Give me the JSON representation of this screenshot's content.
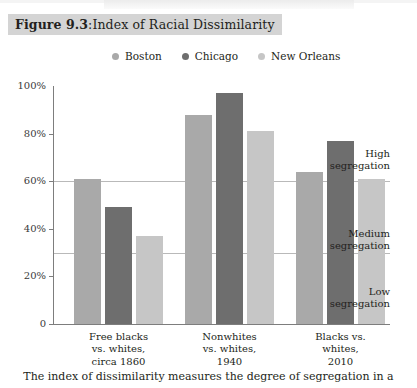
{
  "figure": {
    "number_label": "Figure 9.3",
    "separator": ": ",
    "title": "Index of Racial Dissimilarity",
    "caption": "The index of dissimilarity measures the degree of segregation in a"
  },
  "colors": {
    "boston": "#a9a9a9",
    "chicago": "#6e6e6e",
    "new_orleans": "#c6c6c6",
    "axis": "#7d7d7d",
    "reference_line": "#b9b9b9",
    "title_highlight": "#d4d4d4",
    "text": "#231f20"
  },
  "chart_data": {
    "type": "bar",
    "title": "Index of Racial Dissimilarity",
    "xlabel": "",
    "ylabel": "",
    "ylim": [
      0,
      100
    ],
    "yticks": [
      "0",
      "20%",
      "40%",
      "60%",
      "80%",
      "100%"
    ],
    "ytick_values": [
      0,
      20,
      40,
      60,
      80,
      100
    ],
    "grid": false,
    "legend_position": "top",
    "categories": [
      "Free blacks vs. whites, circa 1860",
      "Nonwhites vs. whites, 1940",
      "Blacks vs. whites, 2010"
    ],
    "category_lines": [
      [
        "Free blacks",
        "vs. whites,",
        "circa 1860"
      ],
      [
        "Nonwhites",
        "vs. whites,",
        "1940"
      ],
      [
        "Blacks vs.",
        "whites,",
        "2010"
      ]
    ],
    "series": [
      {
        "name": "Boston",
        "color": "#a9a9a9",
        "values": [
          61,
          88,
          64
        ]
      },
      {
        "name": "Chicago",
        "color": "#6e6e6e",
        "values": [
          49,
          97,
          77
        ]
      },
      {
        "name": "New Orleans",
        "color": "#c6c6c6",
        "values": [
          37,
          81,
          61
        ]
      }
    ],
    "reference_lines": [
      {
        "value": 60,
        "label_lines": [
          "High",
          "segregation"
        ]
      },
      {
        "value": 30,
        "label_lines": [
          "Medium",
          "segregation"
        ]
      }
    ],
    "annotations": [
      {
        "label_lines": [
          "High",
          "segregation"
        ],
        "band": "above 60%"
      },
      {
        "label_lines": [
          "Medium",
          "segregation"
        ],
        "band": "30%-60%"
      },
      {
        "label_lines": [
          "Low",
          "segregation"
        ],
        "band": "below 30%"
      }
    ]
  }
}
